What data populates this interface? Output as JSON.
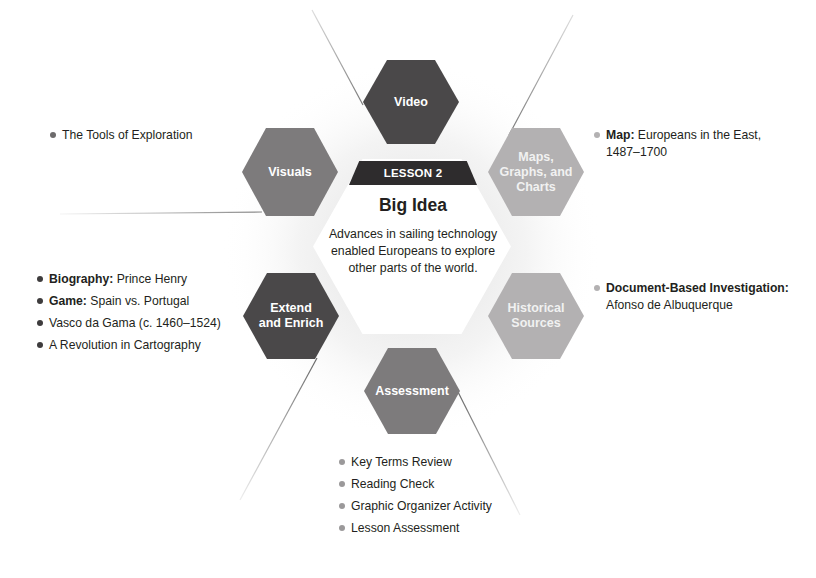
{
  "lesson": {
    "label": "LESSON 2",
    "big_idea_title": "Big Idea",
    "big_idea_text": "Advances in sailing technology enabled Europeans to explore other parts of the world."
  },
  "hexagons": {
    "video": {
      "label": "Video",
      "color": "#4a4849"
    },
    "visuals": {
      "label": "Visuals",
      "color": "#7d7b7c"
    },
    "maps": {
      "label_line1": "Maps,",
      "label_line2": "Graphs, and",
      "label_line3": "Charts",
      "color": "#b3b1b2"
    },
    "extend": {
      "label_line1": "Extend",
      "label_line2": "and Enrich",
      "color": "#4a4849"
    },
    "historical": {
      "label_line1": "Historical",
      "label_line2": "Sources",
      "color": "#b3b1b2"
    },
    "assessment": {
      "label": "Assessment",
      "color": "#7d7b7c"
    }
  },
  "lists": {
    "visuals": [
      {
        "bold": "",
        "text": "The Tools of Exploration"
      }
    ],
    "maps": [
      {
        "bold": "Map:",
        "text": " Europeans in the East,",
        "text2": "1487–1700"
      }
    ],
    "extend": [
      {
        "bold": "Biography:",
        "text": " Prince Henry"
      },
      {
        "bold": "Game:",
        "text": " Spain vs. Portugal"
      },
      {
        "bold": "",
        "text": "Vasco da Gama (c. 1460–1524)"
      },
      {
        "bold": "",
        "text": "A Revolution in Cartography"
      }
    ],
    "historical": [
      {
        "bold": "Document-Based Investigation:",
        "text": "Afonso de Albuquerque"
      }
    ],
    "assessment": [
      {
        "bold": "",
        "text": "Key Terms Review"
      },
      {
        "bold": "",
        "text": "Reading Check"
      },
      {
        "bold": "",
        "text": "Graphic Organizer Activity"
      },
      {
        "bold": "",
        "text": "Lesson Assessment"
      }
    ]
  }
}
